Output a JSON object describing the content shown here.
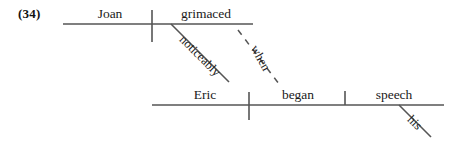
{
  "figure": {
    "number": "(34)",
    "type": "reed-kellogg-sentence-diagram",
    "line_color": "#555555",
    "text_color": "#1a1a1a",
    "background": "#ffffff"
  },
  "clauses": [
    {
      "id": "main-clause",
      "baseline": "top",
      "subject": "Joan",
      "predicate": "grimaced",
      "modifiers": [
        {
          "word": "noticeably",
          "attaches_to": "grimaced",
          "style": "solid-slant"
        }
      ],
      "subordinator": {
        "word": "when",
        "style": "dashed-slant",
        "links": "grimaced-to-began"
      }
    },
    {
      "id": "subordinate-clause",
      "baseline": "bottom",
      "subject": "Eric",
      "predicate": "began",
      "object": "speech",
      "modifiers": [
        {
          "word": "his",
          "attaches_to": "speech",
          "style": "solid-slant"
        }
      ]
    }
  ],
  "labels": {
    "joan": "Joan",
    "grimaced": "grimaced",
    "noticeably": "noticeably",
    "when": "when",
    "eric": "Eric",
    "began": "began",
    "speech": "speech",
    "his": "his"
  }
}
